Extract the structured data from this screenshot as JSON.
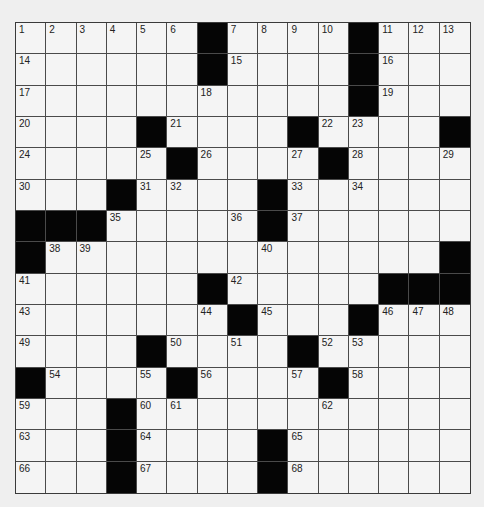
{
  "puzzle": {
    "rows": 15,
    "cols": 15,
    "colors": {
      "background": "#efefef",
      "cell": "#f4f4f4",
      "block": "#050505",
      "line": "#4a4a4a",
      "number": "#222222"
    },
    "grid": [
      [
        "1",
        "2",
        "3",
        "4",
        "5",
        "6",
        "#",
        "7",
        "8",
        "9",
        "10",
        "#",
        "11",
        "12",
        "13"
      ],
      [
        "14",
        "",
        "",
        "",
        "",
        "",
        "#",
        "15",
        "",
        "",
        "",
        "#",
        "16",
        "",
        ""
      ],
      [
        "17",
        "",
        "",
        "",
        "",
        "",
        "18",
        "",
        "",
        "",
        "",
        "#",
        "19",
        "",
        ""
      ],
      [
        "20",
        "",
        "",
        "",
        "#",
        "21",
        "",
        "",
        "",
        "#",
        "22",
        "23",
        "",
        "",
        "#"
      ],
      [
        "24",
        "",
        "",
        "",
        "25",
        "#",
        "26",
        "",
        "",
        "27",
        "#",
        "28",
        "",
        "",
        "29"
      ],
      [
        "30",
        "",
        "",
        "#",
        "31",
        "32",
        "",
        "",
        "#",
        "33",
        "",
        "34",
        "",
        "",
        ""
      ],
      [
        "#",
        "#",
        "#",
        "35",
        "",
        "",
        "",
        "36",
        "#",
        "37",
        "",
        "",
        "",
        "",
        ""
      ],
      [
        "#",
        "38",
        "39",
        "",
        "",
        "",
        "",
        "",
        "40",
        "",
        "",
        "",
        "",
        "",
        "#"
      ],
      [
        "41",
        "",
        "",
        "",
        "",
        "",
        "#",
        "42",
        "",
        "",
        "",
        "",
        "#",
        "#",
        "#"
      ],
      [
        "43",
        "",
        "",
        "",
        "",
        "",
        "44",
        "#",
        "45",
        "",
        "",
        "#",
        "46",
        "47",
        "48"
      ],
      [
        "49",
        "",
        "",
        "",
        "#",
        "50",
        "",
        "51",
        "",
        "#",
        "52",
        "53",
        "",
        "",
        ""
      ],
      [
        "#",
        "54",
        "",
        "",
        "55",
        "#",
        "56",
        "",
        "",
        "57",
        "#",
        "58",
        "",
        "",
        ""
      ],
      [
        "59",
        "",
        "",
        "#",
        "60",
        "61",
        "",
        "",
        "",
        "",
        "62",
        "",
        "",
        "",
        ""
      ],
      [
        "63",
        "",
        "",
        "#",
        "64",
        "",
        "",
        "",
        "#",
        "65",
        "",
        "",
        "",
        "",
        ""
      ],
      [
        "66",
        "",
        "",
        "#",
        "67",
        "",
        "",
        "",
        "#",
        "68",
        "",
        "",
        "",
        "",
        ""
      ]
    ]
  }
}
